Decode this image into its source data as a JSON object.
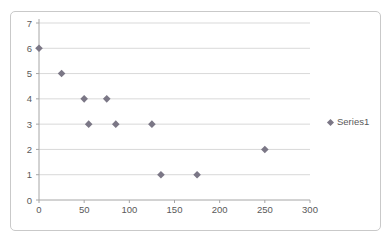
{
  "chart": {
    "legend": {
      "label": "Series1"
    },
    "colors": {
      "marker": "#7b7786",
      "gridline": "#d9d9d9",
      "axis": "#a6a6a6",
      "tick": "#a6a6a6",
      "text": "#595959",
      "frame_border": "#c9c9c9",
      "background": "#ffffff"
    }
  },
  "chart_data": {
    "type": "scatter",
    "title": "",
    "xlabel": "",
    "ylabel": "",
    "xlim": [
      0,
      300
    ],
    "ylim": [
      0,
      7
    ],
    "x_ticks": [
      0,
      50,
      100,
      150,
      200,
      250,
      300
    ],
    "y_ticks": [
      0,
      1,
      2,
      3,
      4,
      5,
      6,
      7
    ],
    "grid": "horizontal-major-only",
    "legend_position": "right",
    "series": [
      {
        "name": "Series1",
        "marker": "diamond",
        "points": [
          [
            0,
            6
          ],
          [
            25,
            5
          ],
          [
            50,
            4
          ],
          [
            55,
            3
          ],
          [
            75,
            4
          ],
          [
            85,
            3
          ],
          [
            125,
            3
          ],
          [
            135,
            1
          ],
          [
            175,
            1
          ],
          [
            250,
            2
          ]
        ]
      }
    ]
  }
}
